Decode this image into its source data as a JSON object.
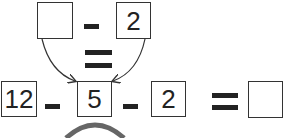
{
  "top_row": {
    "box_left": "",
    "operator": "-",
    "box_right": "2"
  },
  "middle_equals": "=",
  "bottom_row": {
    "box_1": "12",
    "operator_1": "-",
    "box_2": "5",
    "operator_2": "-",
    "box_3": "2",
    "equals": "=",
    "box_result": ""
  },
  "colors": {
    "stroke": "#333333",
    "text": "#222222"
  }
}
